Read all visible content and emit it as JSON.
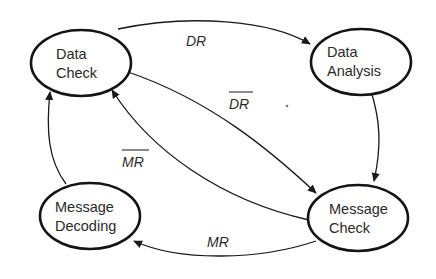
{
  "diagram": {
    "type": "state-transition",
    "nodes": [
      {
        "id": "data-check",
        "line1": "Data",
        "line2": "Check"
      },
      {
        "id": "data-analysis",
        "line1": "Data",
        "line2": "Analysis"
      },
      {
        "id": "message-check",
        "line1": "Message",
        "line2": "Check"
      },
      {
        "id": "message-decoding",
        "line1": "Message",
        "line2": "Decoding"
      }
    ],
    "edges": [
      {
        "from": "data-check",
        "to": "data-analysis",
        "label": "DR",
        "negated": false
      },
      {
        "from": "data-check",
        "to": "message-check",
        "label": "DR",
        "negated": true
      },
      {
        "from": "data-analysis",
        "to": "message-check",
        "label": "",
        "negated": false
      },
      {
        "from": "message-check",
        "to": "data-check",
        "label": "MR",
        "negated": true
      },
      {
        "from": "message-check",
        "to": "message-decoding",
        "label": "MR",
        "negated": false
      },
      {
        "from": "message-decoding",
        "to": "data-check",
        "label": "",
        "negated": false
      }
    ],
    "colors": {
      "stroke": "#141414",
      "text": "#2a2a2a",
      "background": "#ffffff"
    }
  }
}
